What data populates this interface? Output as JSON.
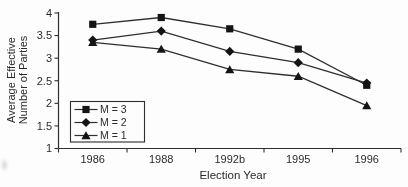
{
  "chart_data": {
    "type": "line",
    "title": "",
    "xlabel": "Election Year",
    "ylabel_lines": [
      "Average Effective",
      "Number of Parties"
    ],
    "categories": [
      "1986",
      "1988",
      "1992b",
      "1995",
      "1996"
    ],
    "series": [
      {
        "name": "M = 3",
        "marker": "square",
        "values": [
          3.75,
          3.9,
          3.65,
          3.2,
          2.4
        ]
      },
      {
        "name": "M = 2",
        "marker": "diamond",
        "values": [
          3.4,
          3.6,
          3.15,
          2.9,
          2.45
        ]
      },
      {
        "name": "M = 1",
        "marker": "triangle",
        "values": [
          3.35,
          3.2,
          2.75,
          2.6,
          1.95
        ]
      }
    ],
    "ylim": [
      1,
      4
    ],
    "yticks": [
      1,
      1.5,
      2,
      2.5,
      3,
      3.5,
      4
    ],
    "ytick_labels": [
      "1",
      "1.5",
      "2",
      "2.5",
      "3",
      "3.5",
      "4"
    ],
    "grid": false,
    "legend_position": "bottom-left-inside",
    "line_color": "#2e2e2e",
    "marker_color": "#141414",
    "text_color": "#2b2b2b"
  }
}
